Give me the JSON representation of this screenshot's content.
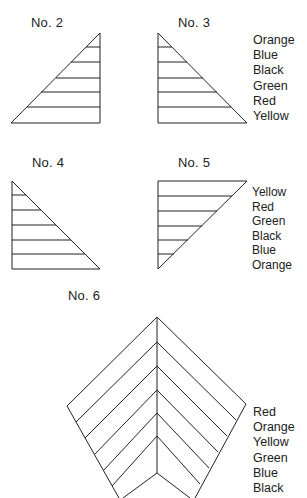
{
  "figures": [
    {
      "id": "no2",
      "label": "No. 2"
    },
    {
      "id": "no3",
      "label": "No. 3",
      "legend": [
        "Orange",
        "Blue",
        "Black",
        "Green",
        "Red",
        "Yellow"
      ]
    },
    {
      "id": "no4",
      "label": "No. 4"
    },
    {
      "id": "no5",
      "label": "No. 5",
      "legend": [
        "Yellow",
        "Red",
        "Green",
        "Black",
        "Blue",
        "Orange"
      ]
    },
    {
      "id": "no6",
      "label": "No. 6",
      "legend": [
        "Red",
        "Orange",
        "Yellow",
        "Green",
        "Blue",
        "Black"
      ]
    }
  ],
  "colors": {
    "line": "#222222",
    "background": "#ffffff"
  }
}
